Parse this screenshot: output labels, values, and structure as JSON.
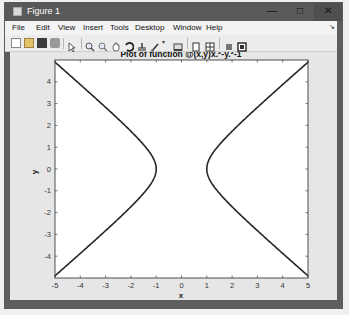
{
  "window": {
    "title": "Figure 1",
    "controls": {
      "minimize": "—",
      "maximize": "□",
      "close": "✕"
    }
  },
  "menubar": {
    "items": [
      "File",
      "Edit",
      "View",
      "Insert",
      "Tools",
      "Desktop",
      "Window",
      "Help"
    ],
    "dock_arrow": "↘"
  },
  "toolbar": {
    "buttons": [
      "new-figure",
      "open-file",
      "save-figure",
      "print-figure",
      "edit-plot",
      "zoom-in",
      "zoom-out",
      "pan",
      "rotate-3d",
      "data-cursor",
      "brush",
      "brush-dropdown",
      "link-plot",
      "insert-colorbar",
      "insert-legend",
      "hide-plot-tools",
      "show-plot-tools"
    ]
  },
  "chart_data": {
    "type": "line",
    "title_display": {
      "prefix": "Plot of function @(x,y)x.",
      "sup1": "2",
      "mid": "-y.",
      "sup2": "2",
      "suffix": "-1"
    },
    "xlabel": "x",
    "ylabel": "y",
    "xlim": [
      -5,
      5
    ],
    "ylim": [
      -5,
      5
    ],
    "xticks": [
      "-5",
      "-4",
      "-3",
      "-2",
      "-1",
      "0",
      "1",
      "2",
      "3",
      "4",
      "5"
    ],
    "yticks": [
      "-4",
      "-3",
      "-2",
      "-1",
      "0",
      "1",
      "2",
      "3",
      "4"
    ],
    "grid": false,
    "series": [
      {
        "name": "left branch",
        "x": [
          -5,
          -4.123,
          -3.162,
          -2.236,
          -1.414,
          -1.0,
          -1.414,
          -2.236,
          -3.162,
          -4.123,
          -5
        ],
        "y": [
          -4.899,
          -4,
          -3,
          -2,
          -1,
          0,
          1,
          2,
          3,
          4,
          4.899
        ]
      },
      {
        "name": "right branch",
        "x": [
          5,
          4.123,
          3.162,
          2.236,
          1.414,
          1.0,
          1.414,
          2.236,
          3.162,
          4.123,
          5
        ],
        "y": [
          -4.899,
          -4,
          -3,
          -2,
          -1,
          0,
          1,
          2,
          3,
          4,
          4.899
        ]
      }
    ],
    "line_color": "#262626"
  }
}
